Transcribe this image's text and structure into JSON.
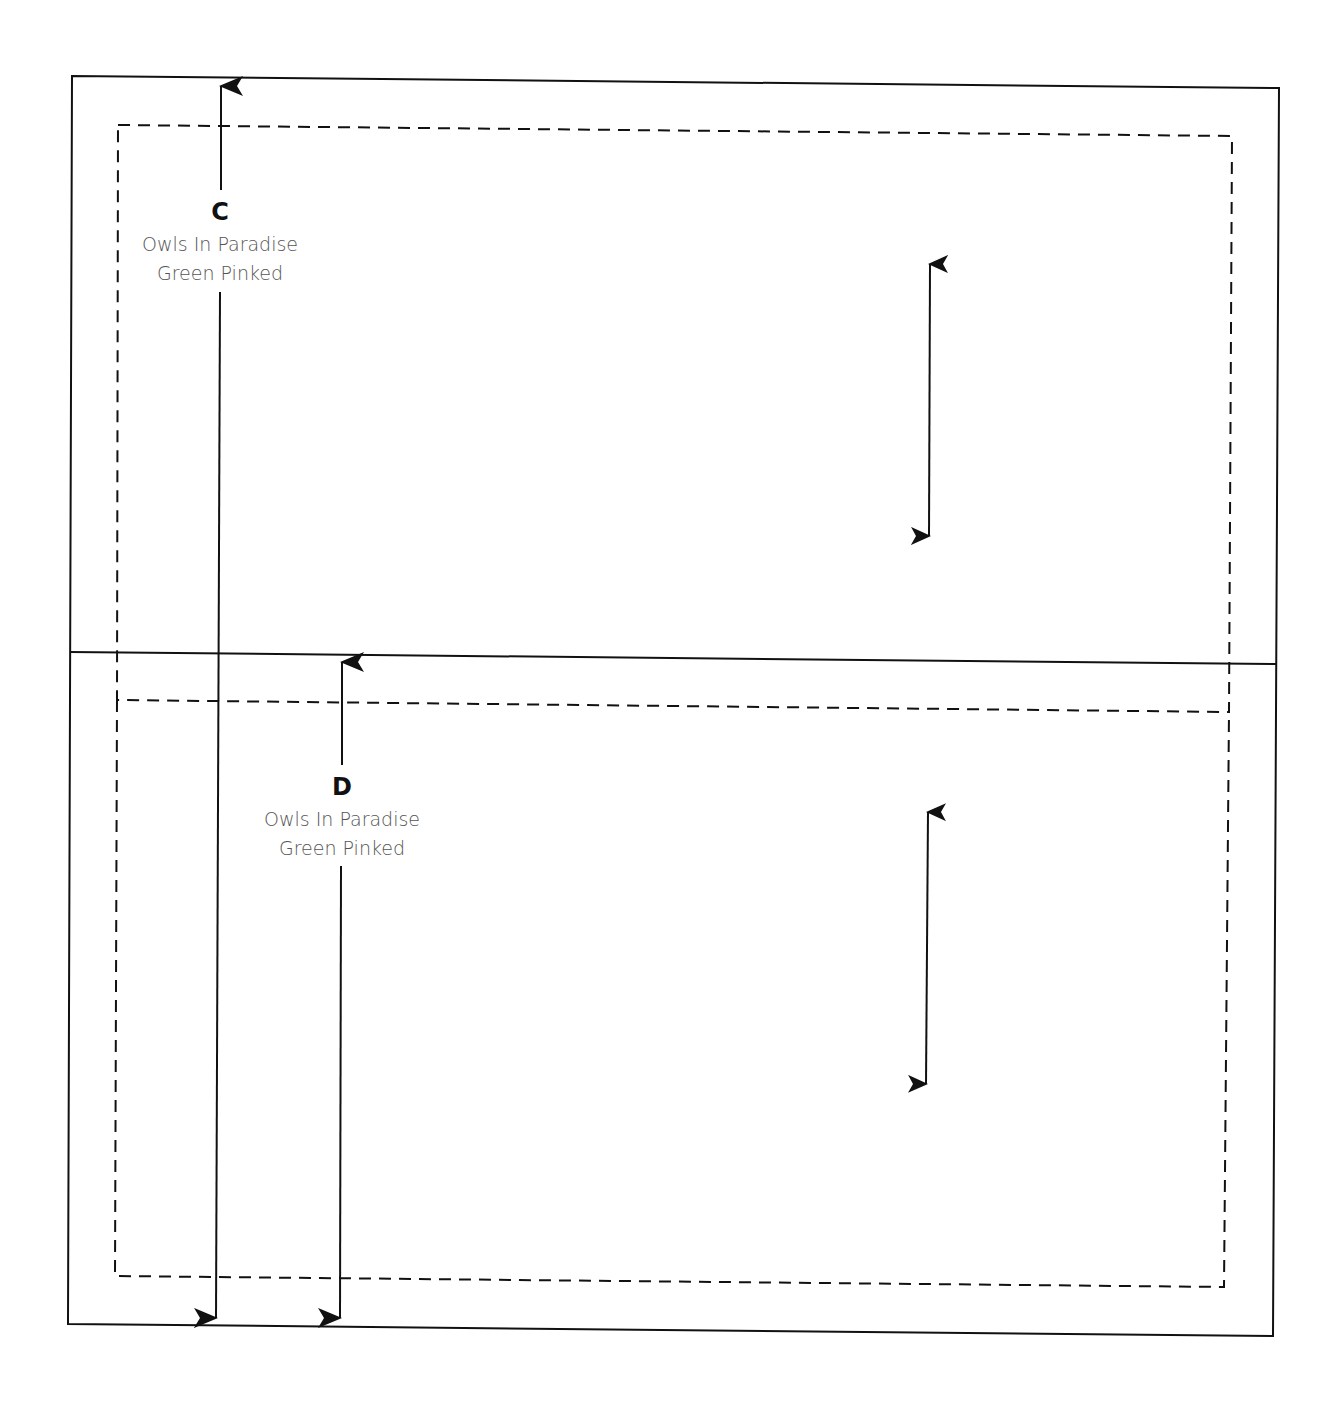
{
  "diagram": {
    "type": "fabric cutting layout",
    "colors": {
      "line": "#111111",
      "text_primary": "#111111",
      "text_secondary": "#555555",
      "background": "#ffffff"
    },
    "pieces": [
      {
        "letter": "C",
        "name": "Owls In Paradise",
        "finish": "Green Pinked"
      },
      {
        "letter": "D",
        "name": "Owls In Paradise",
        "finish": "Green Pinked"
      }
    ]
  }
}
